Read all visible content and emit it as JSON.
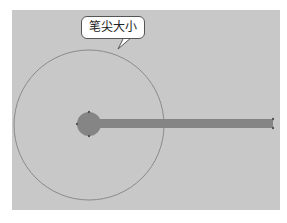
{
  "callout": {
    "label": "笔尖大小"
  },
  "colors": {
    "background": "#c8c8c8",
    "brush": "#858585",
    "outline": "#8a8a8a"
  }
}
